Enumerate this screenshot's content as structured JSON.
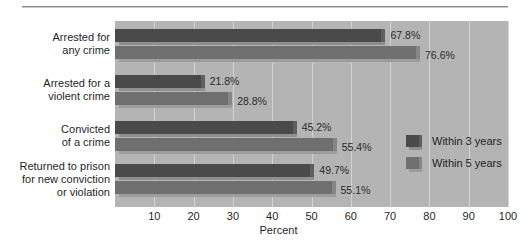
{
  "chart_data": {
    "type": "bar",
    "orientation": "horizontal",
    "title": "",
    "xlabel": "Percent",
    "ylabel": "",
    "xlim": [
      0,
      100
    ],
    "xticks": [
      10,
      20,
      30,
      40,
      50,
      60,
      70,
      80,
      90,
      100
    ],
    "xtick_labels": [
      "10",
      "20",
      "30",
      "40",
      "50",
      "60",
      "70",
      "80",
      "90",
      "100"
    ],
    "grid": true,
    "grid_axis": "x",
    "legend_position": "inside-right",
    "categories": [
      {
        "lines": [
          "Arrested for",
          "any crime"
        ]
      },
      {
        "lines": [
          "Arrested for a",
          "violent crime"
        ]
      },
      {
        "lines": [
          "Convicted",
          "of a crime"
        ]
      },
      {
        "lines": [
          "Returned to prison",
          "for new conviction",
          "or violation"
        ]
      }
    ],
    "series": [
      {
        "name": "Within 3 years",
        "color": "#4a4a4a",
        "values": [
          67.8,
          21.8,
          45.2,
          49.7
        ],
        "labels": [
          "67.8%",
          "21.8%",
          "45.2%",
          "49.7%"
        ]
      },
      {
        "name": "Within 5 years",
        "color": "#6f6f6f",
        "values": [
          76.6,
          28.8,
          55.4,
          55.1
        ],
        "labels": [
          "76.6%",
          "28.8%",
          "55.4%",
          "55.1%"
        ]
      }
    ],
    "plot_background": "#b4b4b4",
    "gridline_color": "#d2d2d2"
  },
  "legend": {
    "entries": [
      {
        "label": "Within 3 years"
      },
      {
        "label": "Within 5 years"
      }
    ]
  }
}
